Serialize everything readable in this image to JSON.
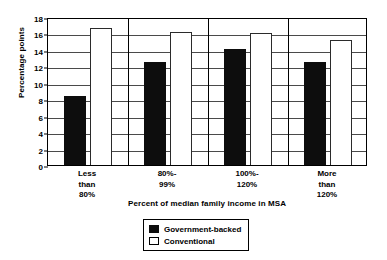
{
  "chart_data": {
    "type": "bar",
    "title": "",
    "xlabel": "Percent of median family income in MSA",
    "ylabel": "Percentage points",
    "categories": [
      "Less\nthan\n80%",
      "80%-\n99%",
      "100%-\n120%",
      "More\nthan\n120%"
    ],
    "ylim": [
      0,
      18
    ],
    "yticks": [
      0,
      2,
      4,
      6,
      8,
      10,
      12,
      14,
      16,
      18
    ],
    "ytick_labels": [
      "0",
      "2",
      "4",
      "6",
      "8",
      "10",
      "12",
      "14",
      "16",
      "18"
    ],
    "grid": "horizontal-and-group-separators",
    "legend_position": "below-axes-center",
    "series": [
      {
        "name": "Government-backed",
        "style": "filled",
        "color": "#0d0d0d",
        "values": [
          8.4,
          12.5,
          14.1,
          12.5
        ]
      },
      {
        "name": "Conventional",
        "style": "hollow",
        "color": "#ffffff",
        "values": [
          16.7,
          16.2,
          16.0,
          15.2
        ]
      }
    ]
  },
  "legend": {
    "items": [
      {
        "label": "Government-backed",
        "style": "filled"
      },
      {
        "label": "Conventional",
        "style": "hollow"
      }
    ]
  }
}
